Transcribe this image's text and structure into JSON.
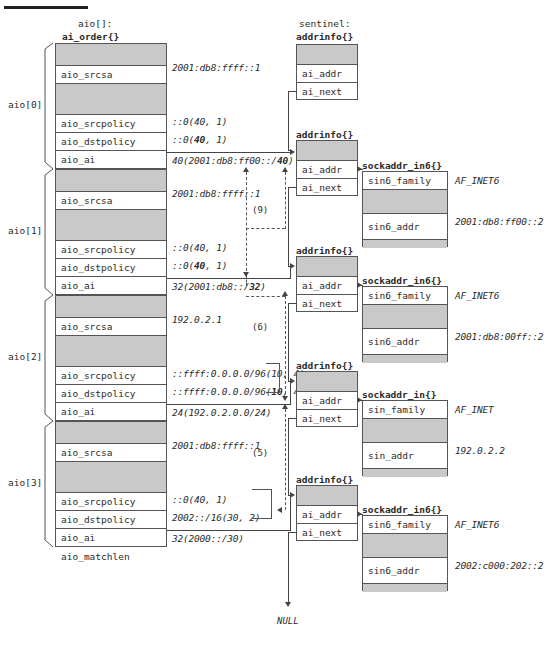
{
  "meta": {
    "top_rule": true
  },
  "labels": {
    "array_caption_line1": "aio[]:",
    "array_caption_line2": "ai_order{}",
    "sentinel_caption_line1": "sentinel:",
    "sentinel_caption_line2": "addrinfo{}",
    "addrinfo_caption": "addrinfo{}",
    "sockaddr_in6_caption": "sockaddr_in6{}",
    "sockaddr_in_caption": "sockaddr_in{}",
    "null_label": "NULL"
  },
  "field_names": {
    "aio_srcsa": "aio_srcsa",
    "aio_srcpolicy": "aio_srcpolicy",
    "aio_dstpolicy": "aio_dstpolicy",
    "aio_ai": "aio_ai",
    "aio_matchlen": "aio_matchlen",
    "ai_addr": "ai_addr",
    "ai_next": "ai_next",
    "sin6_family": "sin6_family",
    "sin6_addr": "sin6_addr",
    "sin_family": "sin_family",
    "sin_addr": "sin_addr"
  },
  "aio_entries": [
    {
      "index_label": "aio[0]",
      "srcsa": "2001:db8:ffff::1",
      "srcpolicy": "::0(40, 1)",
      "dstpolicy_pre": "::0(",
      "dstpolicy_bold": "40",
      "dstpolicy_post": ", 1)",
      "matchlen_pre": "40(2001:db8:ff00::/",
      "matchlen_bold": "40",
      "matchlen_post": ")"
    },
    {
      "index_label": "aio[1]",
      "srcsa": "2001:db8:ffff::1",
      "srcpolicy": "::0(40, 1)",
      "dstpolicy_pre": "::0(",
      "dstpolicy_bold": "40",
      "dstpolicy_post": ", 1)",
      "matchlen_pre": "32(2001:db8::/",
      "matchlen_bold": "32",
      "matchlen_post": ")"
    },
    {
      "index_label": "aio[2]",
      "srcsa": "192.0.2.1",
      "srcpolicy": "::ffff:0.0.0.0/96(10, 4)",
      "dstpolicy_pre": "::ffff:0.0.0.0/96(",
      "dstpolicy_bold": "10",
      "dstpolicy_post": ", 4)",
      "matchlen_pre": "24(192.0.2.0.0/24)",
      "matchlen_bold": "",
      "matchlen_post": ""
    },
    {
      "index_label": "aio[3]",
      "srcsa": "2001:db8:ffff::1",
      "srcpolicy": "::0(40, 1)",
      "dstpolicy_pre": "2002::/16(30, 2)",
      "dstpolicy_bold": "",
      "dstpolicy_post": "",
      "matchlen_pre": "32(2000::/30)",
      "matchlen_bold": "",
      "matchlen_post": ""
    }
  ],
  "addrinfo_nodes": [
    {
      "name": "sentinel",
      "caption_top": "sentinel:",
      "caption": "addrinfo{}"
    },
    {
      "name": "node1",
      "caption": "addrinfo{}"
    },
    {
      "name": "node2",
      "caption": "addrinfo{}"
    },
    {
      "name": "node3",
      "caption": "addrinfo{}"
    },
    {
      "name": "node4",
      "caption": "addrinfo{}"
    }
  ],
  "sockaddrs": [
    {
      "caption": "sockaddr_in6{}",
      "family_field": "sin6_family",
      "family_value": "AF_INET6",
      "addr_field": "sin6_addr",
      "addr_value": "2001:db8:ff00::2"
    },
    {
      "caption": "sockaddr_in6{}",
      "family_field": "sin6_family",
      "family_value": "AF_INET6",
      "addr_field": "sin6_addr",
      "addr_value": "2001:db8:00ff::2"
    },
    {
      "caption": "sockaddr_in{}",
      "family_field": "sin_family",
      "family_value": "AF_INET",
      "addr_field": "sin_addr",
      "addr_value": "192.0.2.2"
    },
    {
      "caption": "sockaddr_in6{}",
      "family_field": "sin6_family",
      "family_value": "AF_INET6",
      "addr_field": "sin6_addr",
      "addr_value": "2002:c000:202::2"
    }
  ],
  "annotations": [
    {
      "id": "a9",
      "text": "(9)"
    },
    {
      "id": "a6",
      "text": "(6)"
    },
    {
      "id": "a5",
      "text": "(5)"
    }
  ],
  "colors": {
    "gray_fill": "#c9c9c9",
    "stroke": "#555555",
    "text": "#2b2b2b",
    "background": "#ffffff"
  }
}
